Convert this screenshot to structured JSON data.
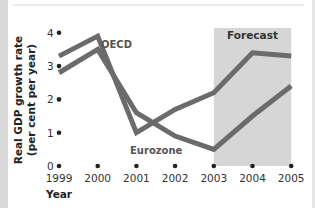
{
  "chart_data": {
    "type": "line",
    "title": "",
    "xlabel": "Year",
    "ylabel": "Real GDP growth rate (per cent per year)",
    "ylabel_lines": [
      "Real GDP growth rate",
      "(per cent per year)"
    ],
    "x": [
      "1999",
      "2000",
      "2001",
      "2002",
      "2003",
      "2004",
      "2005"
    ],
    "yticks": [
      "0",
      "1",
      "2",
      "3",
      "4"
    ],
    "ylim": [
      0,
      4
    ],
    "grid": false,
    "legend": "inline labels",
    "series": [
      {
        "name": "OECD",
        "values": [
          3.3,
          3.9,
          1.0,
          1.7,
          2.2,
          3.4,
          3.3
        ],
        "color": "#6b6b6b"
      },
      {
        "name": "Eurozone",
        "values": [
          2.8,
          3.5,
          1.6,
          0.9,
          0.5,
          1.5,
          2.4
        ],
        "color": "#6b6b6b"
      }
    ],
    "annotations": [
      {
        "text": "Forecast",
        "shaded_region": [
          "2003",
          "2005"
        ],
        "color": "#d6d6d6"
      }
    ]
  }
}
